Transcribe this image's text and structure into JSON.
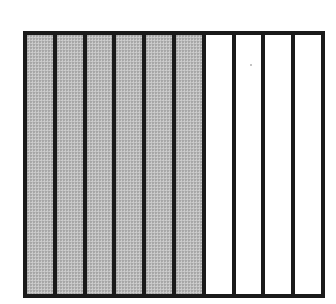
{
  "diagram": {
    "type": "fraction-bar",
    "total_parts": 10,
    "shaded_parts": 6,
    "unshaded_parts": 4,
    "fraction_shaded": "6/10",
    "colors": {
      "outline": "#1a1a1a",
      "shaded_fill": "#bdbdbd",
      "unshaded_fill": "#ffffff"
    },
    "columns": [
      {
        "index": 1,
        "shaded": true
      },
      {
        "index": 2,
        "shaded": true
      },
      {
        "index": 3,
        "shaded": true
      },
      {
        "index": 4,
        "shaded": true
      },
      {
        "index": 5,
        "shaded": true
      },
      {
        "index": 6,
        "shaded": true
      },
      {
        "index": 7,
        "shaded": false
      },
      {
        "index": 8,
        "shaded": false
      },
      {
        "index": 9,
        "shaded": false
      },
      {
        "index": 10,
        "shaded": false
      }
    ]
  }
}
